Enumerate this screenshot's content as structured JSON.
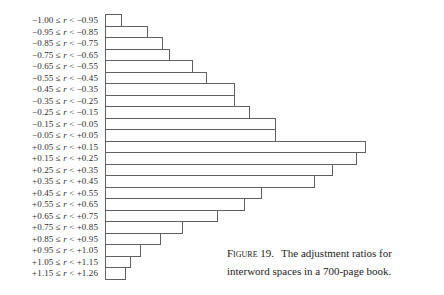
{
  "figure": {
    "caption": {
      "figure_label": "Figure 19.",
      "line1": "The adjustment ratios for",
      "line2": "interword spaces in a 700-page book."
    }
  },
  "chart_data": {
    "type": "bar",
    "orientation": "horizontal",
    "title": "",
    "xlabel": "",
    "ylabel": "",
    "grid": false,
    "legend": false,
    "axis_scale_visible": false,
    "units_note": "No numeric axis is shown; values are relative bar lengths (arbitrary units proportional to frequency), measured in px from the screenshot.",
    "categories": [
      "−1.00 ≤ r < −0.95",
      "−0.95 ≤ r < −0.85",
      "−0.85 ≤ r < −0.75",
      "−0.75 ≤ r < −0.65",
      "−0.65 ≤ r < −0.55",
      "−0.55 ≤ r < −0.45",
      "−0.45 ≤ r < −0.35",
      "−0.35 ≤ r < −0.25",
      "−0.25 ≤ r < −0.15",
      "−0.15 ≤ r < −0.05",
      "−0.05 ≤ r < +0.05",
      "+0.05 ≤ r < +0.15",
      "+0.15 ≤ r < +0.25",
      "+0.25 ≤ r < +0.35",
      "+0.35 ≤ r < +0.45",
      "+0.45 ≤ r < +0.55",
      "+0.55 ≤ r < +0.65",
      "+0.65 ≤ r < +0.75",
      "+0.75 ≤ r < +0.85",
      "+0.85 ≤ r < +0.95",
      "+0.95 ≤ r < +1.05",
      "+1.05 ≤ r < +1.15",
      "+1.15 ≤ r < +1.26"
    ],
    "values": [
      17,
      43,
      58,
      65,
      88,
      102,
      130,
      130,
      145,
      171,
      171,
      261,
      252,
      228,
      210,
      157,
      140,
      113,
      78,
      56,
      36,
      26,
      21
    ]
  },
  "colors": {
    "background": "#ffffff",
    "bar_outline": "#606060",
    "text": "#2b2b2b"
  }
}
